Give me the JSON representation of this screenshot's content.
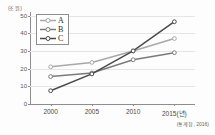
{
  "chart_data": {
    "type": "line",
    "title": "",
    "unit_label": "(조 원)",
    "xlabel": "",
    "ylabel": "",
    "categories": [
      "2000",
      "2005",
      "2010",
      "2015(년)"
    ],
    "x_values": [
      2000,
      2005,
      2010,
      2015
    ],
    "yticks": [
      0,
      10,
      20,
      30,
      40,
      50
    ],
    "ylim": [
      0,
      52
    ],
    "grid": true,
    "legend_position": "top-left",
    "source_note": "(통계청, 2016)",
    "series": [
      {
        "name": "A",
        "values": [
          21,
          23.5,
          30,
          37
        ],
        "color": "#a8a8a8"
      },
      {
        "name": "B",
        "values": [
          15.5,
          17.5,
          25,
          29
        ],
        "color": "#7b7b7b"
      },
      {
        "name": "C",
        "values": [
          7.5,
          17,
          30,
          46.5
        ],
        "color": "#4a4a4a"
      }
    ]
  }
}
